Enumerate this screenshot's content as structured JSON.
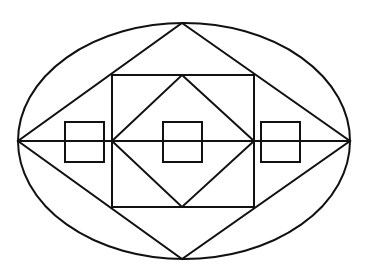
{
  "diagram": {
    "title": "",
    "stroke_color": "#111111",
    "background_color": "#ffffff",
    "elements": [
      {
        "name": "outer-ellipse",
        "shape": "ellipse"
      },
      {
        "name": "outer-diamond",
        "shape": "rhombus"
      },
      {
        "name": "central-square",
        "shape": "square"
      },
      {
        "name": "inner-diamond",
        "shape": "rhombus"
      },
      {
        "name": "horizontal-axis-line",
        "shape": "line"
      },
      {
        "name": "small-square-left",
        "shape": "square"
      },
      {
        "name": "small-square-center",
        "shape": "square"
      },
      {
        "name": "small-square-right",
        "shape": "square"
      }
    ],
    "small_square_count": 3
  }
}
